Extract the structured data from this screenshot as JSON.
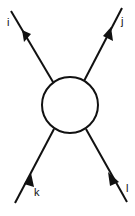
{
  "diagram": {
    "type": "scattering-vertex",
    "colors": {
      "line": "#111111",
      "background": "#ffffff"
    },
    "vertex": {
      "shape": "circle",
      "cx": 70,
      "cy": 105,
      "r": 28
    },
    "legs": [
      {
        "label": "i",
        "position": "top-left",
        "direction": "outgoing"
      },
      {
        "label": "j",
        "position": "top-right",
        "direction": "outgoing"
      },
      {
        "label": "k",
        "position": "bottom-left",
        "direction": "incoming"
      },
      {
        "label": "l",
        "position": "bottom-right",
        "direction": "incoming"
      }
    ]
  }
}
